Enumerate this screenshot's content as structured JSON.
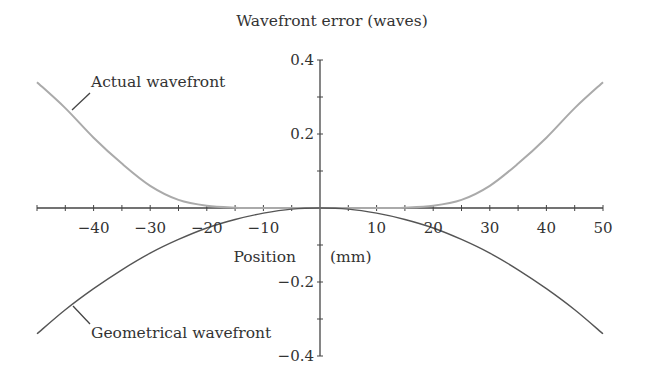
{
  "chart_data": {
    "type": "line",
    "title": "Wavefront error (waves)",
    "xlabel": "Position (mm)",
    "ylabel": "Wavefront error (waves)",
    "xlim": [
      -50,
      50
    ],
    "ylim": [
      -0.4,
      0.4
    ],
    "grid": false,
    "legend": "none (inline annotations)",
    "x_ticks": [
      -40,
      -30,
      -20,
      -10,
      10,
      20,
      30,
      40,
      50
    ],
    "x_tick_labels": [
      "−40",
      "−30",
      "−20",
      "−10",
      "10",
      "20",
      "30",
      "40",
      "50"
    ],
    "x_minor_ticks": [
      -45,
      -35,
      -25,
      -15,
      -5,
      5,
      15,
      25,
      35,
      45
    ],
    "y_ticks": [
      0.4,
      0.2,
      -0.2,
      -0.4
    ],
    "y_tick_labels": [
      "0.4",
      "0.2",
      "−0.2",
      "−0.4"
    ],
    "y_minor_ticks": [
      0.3,
      0.1,
      -0.1,
      -0.3
    ],
    "x": [
      -50,
      -45,
      -40,
      -35,
      -30,
      -25,
      -20,
      -15,
      -10,
      -5,
      0,
      5,
      10,
      15,
      20,
      25,
      30,
      35,
      40,
      45,
      50
    ],
    "series": [
      {
        "name": "Actual wavefront",
        "color": "#aaaaaa",
        "values": [
          0.34,
          0.27,
          0.19,
          0.12,
          0.06,
          0.022,
          0.006,
          0.001,
          0.0,
          0.0,
          0.0,
          0.0,
          0.0,
          0.001,
          0.006,
          0.022,
          0.06,
          0.12,
          0.19,
          0.27,
          0.34
        ]
      },
      {
        "name": "Geometrical wavefront",
        "color": "#555555",
        "values": [
          -0.34,
          -0.275,
          -0.218,
          -0.167,
          -0.122,
          -0.085,
          -0.054,
          -0.031,
          -0.014,
          -0.003,
          0.0,
          -0.003,
          -0.014,
          -0.031,
          -0.054,
          -0.085,
          -0.122,
          -0.167,
          -0.218,
          -0.275,
          -0.34
        ]
      }
    ],
    "annotations": [
      {
        "text": "Actual wavefront",
        "series": 0,
        "at_x": -44
      },
      {
        "text": "Geometrical wavefront",
        "series": 1,
        "at_x": -44
      }
    ]
  },
  "labels": {
    "title": "Wavefront error (waves)",
    "x_axis_word1": "Position",
    "x_axis_word2": "(mm)",
    "annot_actual": "Actual wavefront",
    "annot_geometrical": "Geometrical wavefront"
  }
}
